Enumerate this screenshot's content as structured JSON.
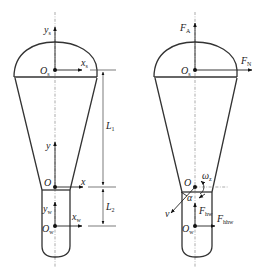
{
  "figure": {
    "left": {
      "title": "coordinate-frames",
      "labels": {
        "ys": "y",
        "ys_sub": "s",
        "xs": "x",
        "xs_sub": "s",
        "Os": "O",
        "Os_sub": "s",
        "y": "y",
        "x": "x",
        "O": "O",
        "yw": "y",
        "yw_sub": "w",
        "xw": "x",
        "xw_sub": "w",
        "Ow": "O",
        "Ow_sub": "w"
      },
      "dimensions": {
        "L1": "L",
        "L1_sub": "1",
        "L2": "L",
        "L2_sub": "2"
      }
    },
    "right": {
      "title": "force-diagram",
      "labels": {
        "FA": "F",
        "FA_sub": "A",
        "FN": "F",
        "FN_sub": "N",
        "Os": "O",
        "Os_sub": "s",
        "O": "O",
        "omega": "ω",
        "omega_sub": "z",
        "alpha": "α",
        "v": "v",
        "Fhw": "F",
        "Fhw_sub": "hw",
        "Fhhw": "F",
        "Fhhw_sub": "hhw",
        "Ow": "O",
        "Ow_sub": "w"
      }
    },
    "colors": {
      "line": "#333333",
      "centerline": "#888888",
      "background": "#ffffff"
    }
  }
}
